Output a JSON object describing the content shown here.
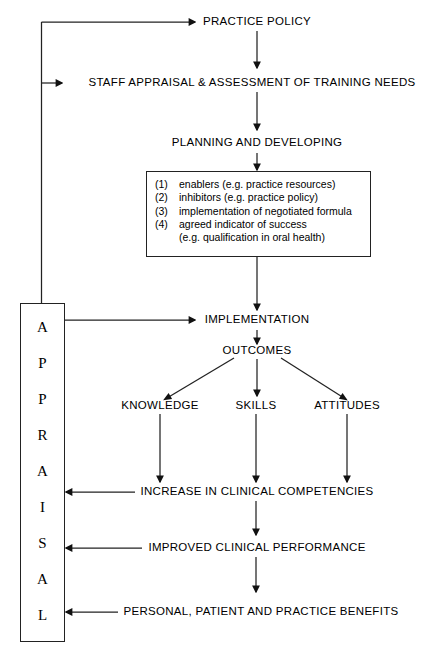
{
  "diagram": {
    "nodes": {
      "practice_policy": "PRACTICE POLICY",
      "staff_appraisal": "STAFF APPRAISAL & ASSESSMENT OF TRAINING NEEDS",
      "planning": "PLANNING AND DEVELOPING",
      "implementation": "IMPLEMENTATION",
      "outcomes": "OUTCOMES",
      "knowledge": "KNOWLEDGE",
      "skills": "SKILLS",
      "attitudes": "ATTITUDES",
      "increase": "INCREASE IN CLINICAL COMPETENCIES",
      "improved": "IMPROVED CLINICAL PERFORMANCE",
      "benefits": "PERSONAL, PATIENT AND PRACTICE BENEFITS"
    },
    "detail_box": {
      "items": [
        {
          "num": "(1)",
          "text": "enablers (e.g. practice resources)",
          "continuation": ""
        },
        {
          "num": "(2)",
          "text": "inhibitors (e.g. practice policy)",
          "continuation": ""
        },
        {
          "num": "(3)",
          "text": "implementation of negotiated formula",
          "continuation": ""
        },
        {
          "num": "(4)",
          "text": "agreed indicator of success",
          "continuation": "(e.g. qualification in oral health)"
        }
      ]
    },
    "appraisal_column": {
      "word": "APPRAISAL",
      "letters": [
        "A",
        "P",
        "P",
        "R",
        "A",
        "I",
        "S",
        "A",
        "L"
      ]
    },
    "colors": {
      "line": "#222222",
      "text": "#000000",
      "background": "#ffffff"
    }
  }
}
